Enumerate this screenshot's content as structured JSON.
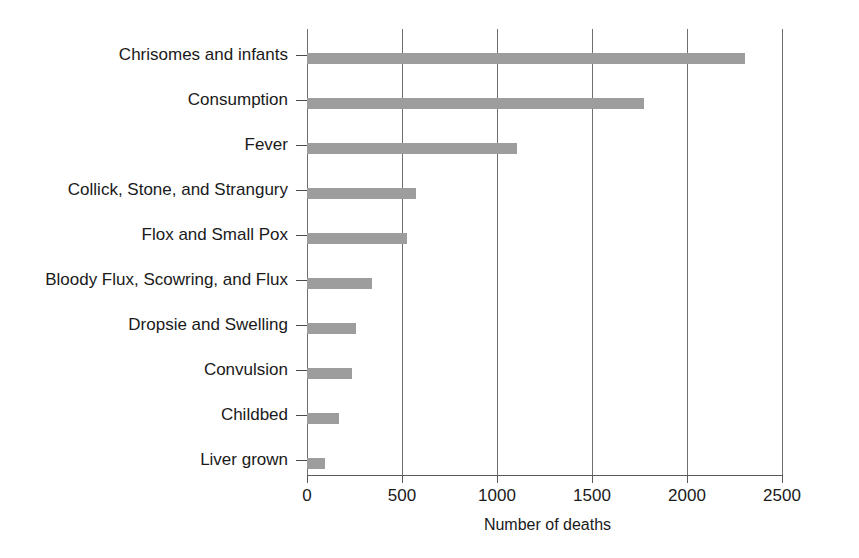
{
  "chart_data": {
    "type": "bar",
    "orientation": "horizontal",
    "title": "",
    "xlabel": "Number of deaths",
    "ylabel": "",
    "xlim": [
      0,
      2500
    ],
    "ylim": null,
    "grid": "vertical",
    "legend": null,
    "bar_color": "#9d9d9d",
    "axis_color": "#6e6e6e",
    "xticks": [
      0,
      500,
      1000,
      1500,
      2000,
      2500
    ],
    "xtick_labels": [
      "0",
      "500",
      "1000",
      "1500",
      "2000",
      "2500"
    ],
    "categories": [
      "Chrisomes and infants",
      "Consumption",
      "Fever",
      "Collick, Stone, and Strangury",
      "Flox and Small Pox",
      "Bloody Flux, Scowring, and Flux",
      "Dropsie and Swelling",
      "Convulsion",
      "Childbed",
      "Liver grown"
    ],
    "values": [
      2300,
      1770,
      1105,
      570,
      525,
      340,
      255,
      235,
      170,
      95
    ]
  }
}
